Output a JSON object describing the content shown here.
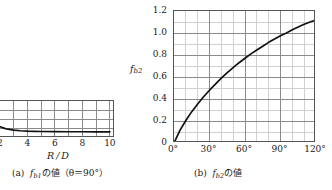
{
  "figures": [
    {
      "key": "a",
      "caption_prefix": "(a)",
      "caption_symbol": "f",
      "caption_subscript": "b1",
      "caption_suffix": "の値（θ＝90°）",
      "caption_plain": "(a) fb1の値(θ=90°)",
      "axis_title": "R / D",
      "x_tick_labels": [
        "2",
        "4",
        "6",
        "8",
        "10"
      ],
      "y_tick_labels": [],
      "note": "left figure is clipped by the page edge; only the right portion of the plot box is visible"
    },
    {
      "key": "b",
      "caption_prefix": "(b)",
      "caption_symbol": "f",
      "caption_subscript": "b2",
      "caption_suffix": "の値",
      "caption_plain": "(b) fb2の値",
      "y_axis_symbol": "f",
      "y_axis_subscript": "b2",
      "x_tick_labels": [
        "0°",
        "30°",
        "60°",
        "90°",
        "120°"
      ],
      "y_tick_labels": [
        "0",
        "0.2",
        "0.4",
        "0.6",
        "0.8",
        "1.0",
        "1.2"
      ]
    }
  ],
  "colors": {
    "curve": "#111111",
    "axis": "#555555",
    "grid_major": "#8a8a8a",
    "grid_minor": "#d0d0d0",
    "background": "#ffffff",
    "text": "#1a1a1a"
  },
  "chart_data": [
    {
      "type": "line",
      "title": "(a) fb1の値(θ=90°)",
      "xlabel": "R/D",
      "ylabel": "fb1",
      "xlim": [
        1,
        10
      ],
      "ylim": [
        0,
        1.2
      ],
      "xticks": [
        2,
        4,
        6,
        8,
        10
      ],
      "yticks": [],
      "grid": true,
      "legend": "none",
      "clipped_left": true,
      "x": [
        1.0,
        1.2,
        1.4,
        1.6,
        1.8,
        2.0,
        2.2,
        2.4,
        2.6,
        2.8,
        3.0,
        3.5,
        4.0,
        4.5,
        5.0,
        6.0,
        7.0,
        8.0,
        9.0,
        10.0
      ],
      "y": [
        0.74,
        0.62,
        0.53,
        0.46,
        0.41,
        0.37,
        0.335,
        0.305,
        0.285,
        0.27,
        0.255,
        0.235,
        0.222,
        0.215,
        0.21,
        0.205,
        0.203,
        0.202,
        0.201,
        0.2
      ]
    },
    {
      "type": "line",
      "title": "(b) fb2の値",
      "xlabel": "θ (deg)",
      "ylabel": "fb2",
      "xlim": [
        0,
        120
      ],
      "ylim": [
        0,
        1.2
      ],
      "xticks": [
        0,
        30,
        60,
        90,
        120
      ],
      "xticks_minor_step": 10,
      "yticks": [
        0,
        0.2,
        0.4,
        0.6,
        0.8,
        1.0,
        1.2
      ],
      "yticks_minor_step": 0.1,
      "grid": true,
      "legend": "none",
      "x": [
        0,
        5,
        10,
        15,
        20,
        25,
        30,
        35,
        40,
        45,
        50,
        55,
        60,
        65,
        70,
        75,
        80,
        85,
        90,
        95,
        100,
        105,
        110,
        115,
        120
      ],
      "y": [
        0.0,
        0.115,
        0.205,
        0.285,
        0.355,
        0.42,
        0.48,
        0.535,
        0.59,
        0.64,
        0.685,
        0.73,
        0.77,
        0.81,
        0.845,
        0.88,
        0.915,
        0.945,
        0.975,
        1.0,
        1.03,
        1.055,
        1.08,
        1.1,
        1.12
      ]
    }
  ]
}
